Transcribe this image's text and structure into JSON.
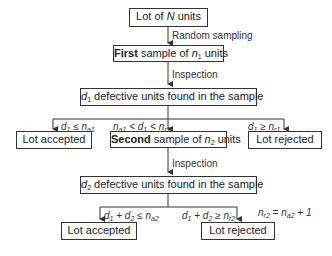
{
  "diagram": {
    "type": "flowchart",
    "nodes": {
      "lot": {
        "prefix": "Lot of ",
        "var": "N",
        "suffix": " units"
      },
      "first_sample": {
        "bold": "First",
        "text": " sample of ",
        "var": "n",
        "sub": "1",
        "suffix": " units"
      },
      "d1_found": {
        "var": "d",
        "sub": "1",
        "text": " defective units found in the sample"
      },
      "accepted_1": {
        "text": "Lot accepted"
      },
      "second_sample": {
        "bold": "Second",
        "text": " sample of ",
        "var": "n",
        "sub": "2",
        "suffix": " units"
      },
      "rejected_1": {
        "text": "Lot rejected"
      },
      "d2_found": {
        "var": "d",
        "sub": "2",
        "text": " defective units found in the sample"
      },
      "accepted_2": {
        "text": "Lot accepted"
      },
      "rejected_2": {
        "text": "Lot rejected"
      }
    },
    "edges": {
      "random_sampling": "Random sampling",
      "inspection_1": "Inspection",
      "inspection_2": "Inspection",
      "cond_accept_1": "d1 ≤ na1",
      "cond_second": "na1 < d1 < nr1",
      "cond_reject_1": "d1 ≥ nr1",
      "cond_accept_2": "d1 + d2 ≤ na2",
      "cond_reject_2": "d1 + d2 ≥ nr2"
    },
    "annotation": "nr2 = na2 + 1",
    "colors": {
      "line": "#333333",
      "background": "#ffffff"
    }
  }
}
